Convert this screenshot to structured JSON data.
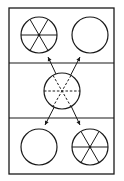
{
  "diagram": {
    "colors": {
      "stroke": "#1a1a1a",
      "background": "#ffffff"
    },
    "frame": {
      "x": 9,
      "y": 8,
      "width": 105,
      "height": 166
    },
    "dividers": [
      63,
      118
    ],
    "panels": [
      {
        "name": "top",
        "circles": [
          {
            "cx": 39,
            "cy": 35,
            "r": 18,
            "spokes": "solid"
          },
          {
            "cx": 90,
            "cy": 35,
            "r": 18,
            "spokes": "none"
          }
        ]
      },
      {
        "name": "middle",
        "circles": [
          {
            "cx": 62,
            "cy": 91,
            "r": 18,
            "spokes": "dashed"
          }
        ]
      },
      {
        "name": "bottom",
        "circles": [
          {
            "cx": 39,
            "cy": 147,
            "r": 18,
            "spokes": "none"
          },
          {
            "cx": 90,
            "cy": 147,
            "r": 18,
            "spokes": "solid"
          }
        ]
      }
    ],
    "arrows": [
      {
        "from": [
          80,
          125
        ],
        "to": [
          48,
          57
        ],
        "note": "crossing line, arrowhead top-left"
      },
      {
        "from": [
          45,
          125
        ],
        "to": [
          80,
          57
        ],
        "note": "crossing line, arrowhead top-right"
      },
      {
        "from": [
          48,
          57
        ],
        "to": [
          80,
          125
        ],
        "note": "arrowhead bottom-right"
      },
      {
        "from": [
          80,
          57
        ],
        "to": [
          45,
          125
        ],
        "note": "arrowhead bottom-left"
      }
    ]
  }
}
